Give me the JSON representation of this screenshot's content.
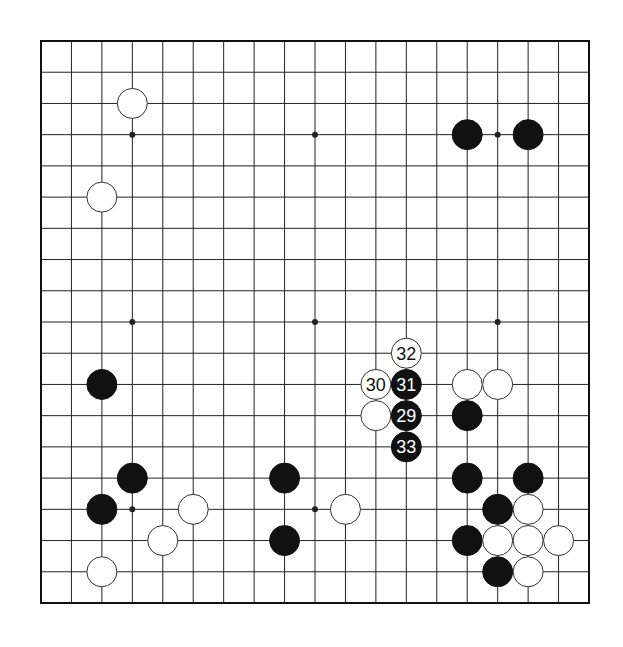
{
  "board": {
    "size": 19,
    "origin": {
      "x": 41,
      "y": 41
    },
    "end": {
      "x": 589,
      "y": 603
    },
    "line_color": "#222222",
    "border_color": "#111111",
    "background": "#ffffff",
    "star_points": [
      [
        3,
        3
      ],
      [
        9,
        3
      ],
      [
        15,
        3
      ],
      [
        3,
        9
      ],
      [
        9,
        9
      ],
      [
        15,
        9
      ],
      [
        3,
        15
      ],
      [
        9,
        15
      ],
      [
        15,
        15
      ]
    ]
  },
  "colors": {
    "black_stone": "#111111",
    "white_stone": "#ffffff",
    "white_stone_outline": "#333333",
    "black_label": "#ffffff",
    "white_label": "#111111"
  },
  "stones": [
    {
      "color": "white",
      "col": 3,
      "row": 2,
      "label": ""
    },
    {
      "color": "white",
      "col": 2,
      "row": 5,
      "label": ""
    },
    {
      "color": "black",
      "col": 14,
      "row": 3,
      "label": ""
    },
    {
      "color": "black",
      "col": 16,
      "row": 3,
      "label": ""
    },
    {
      "color": "black",
      "col": 2,
      "row": 11,
      "label": ""
    },
    {
      "color": "white",
      "col": 12,
      "row": 10,
      "label": "32"
    },
    {
      "color": "white",
      "col": 11,
      "row": 11,
      "label": "30"
    },
    {
      "color": "black",
      "col": 12,
      "row": 11,
      "label": "31"
    },
    {
      "color": "white",
      "col": 14,
      "row": 11,
      "label": ""
    },
    {
      "color": "white",
      "col": 15,
      "row": 11,
      "label": ""
    },
    {
      "color": "white",
      "col": 11,
      "row": 12,
      "label": ""
    },
    {
      "color": "black",
      "col": 12,
      "row": 12,
      "label": "29"
    },
    {
      "color": "black",
      "col": 14,
      "row": 12,
      "label": ""
    },
    {
      "color": "black",
      "col": 12,
      "row": 13,
      "label": "33"
    },
    {
      "color": "black",
      "col": 3,
      "row": 14,
      "label": ""
    },
    {
      "color": "black",
      "col": 8,
      "row": 14,
      "label": ""
    },
    {
      "color": "black",
      "col": 14,
      "row": 14,
      "label": ""
    },
    {
      "color": "black",
      "col": 16,
      "row": 14,
      "label": ""
    },
    {
      "color": "black",
      "col": 2,
      "row": 15,
      "label": ""
    },
    {
      "color": "white",
      "col": 5,
      "row": 15,
      "label": ""
    },
    {
      "color": "white",
      "col": 10,
      "row": 15,
      "label": ""
    },
    {
      "color": "black",
      "col": 15,
      "row": 15,
      "label": ""
    },
    {
      "color": "white",
      "col": 16,
      "row": 15,
      "label": ""
    },
    {
      "color": "white",
      "col": 4,
      "row": 16,
      "label": ""
    },
    {
      "color": "black",
      "col": 8,
      "row": 16,
      "label": ""
    },
    {
      "color": "black",
      "col": 14,
      "row": 16,
      "label": ""
    },
    {
      "color": "white",
      "col": 15,
      "row": 16,
      "label": ""
    },
    {
      "color": "white",
      "col": 16,
      "row": 16,
      "label": ""
    },
    {
      "color": "white",
      "col": 17,
      "row": 16,
      "label": ""
    },
    {
      "color": "white",
      "col": 2,
      "row": 17,
      "label": ""
    },
    {
      "color": "black",
      "col": 15,
      "row": 17,
      "label": ""
    },
    {
      "color": "white",
      "col": 16,
      "row": 17,
      "label": ""
    }
  ]
}
